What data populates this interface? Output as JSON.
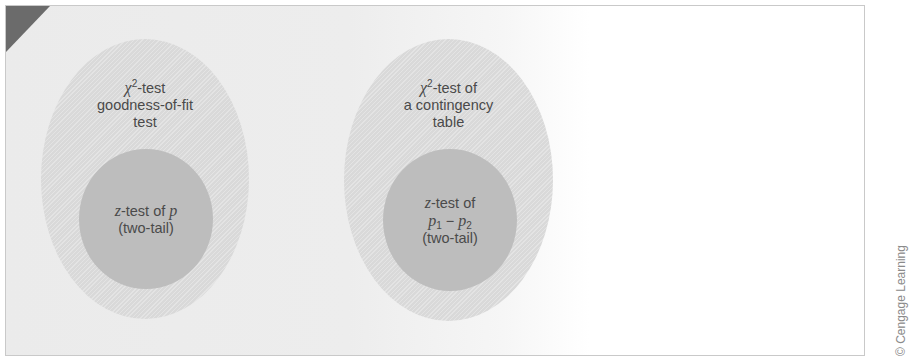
{
  "diagram": {
    "title": "",
    "colors": {
      "frame_border": "#c9c9c9",
      "corner_triangle": "#6b6b6b",
      "outer_ellipse": "#d9d9d9",
      "inner_circle": "#bdbdbd",
      "text": "#4a4a4a"
    },
    "groups": [
      {
        "outer": {
          "symbol": "χ",
          "superscript": "2",
          "line1_rest": "-test",
          "line2": "goodness-of-fit",
          "line3": "test"
        },
        "inner": {
          "var": "z",
          "line1_rest": "-test of ",
          "param": "p",
          "line2": "(two-tail)"
        }
      },
      {
        "outer": {
          "symbol": "χ",
          "superscript": "2",
          "line1_rest": "-test of",
          "line2": "a contingency",
          "line3": "table"
        },
        "inner": {
          "var": "z",
          "line1_rest": "-test of",
          "p1": "p",
          "p1_sub": "1",
          "minus": " − ",
          "p2": "p",
          "p2_sub": "2",
          "line3": "(two-tail)"
        }
      }
    ],
    "copyright": "© Cengage Learning"
  }
}
